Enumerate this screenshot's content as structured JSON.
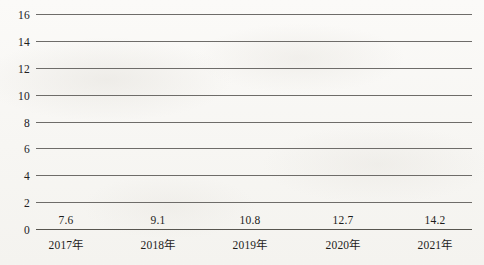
{
  "chart_data": {
    "type": "bar",
    "title": "",
    "subtitle": "",
    "xlabel": "",
    "ylabel": "",
    "categories": [
      "2017年",
      "2018年",
      "2019年",
      "2020年",
      "2021年"
    ],
    "values": [
      7.6,
      9.1,
      10.8,
      12.7,
      14.2
    ],
    "value_labels": [
      "7.6",
      "9.1",
      "10.8",
      "12.7",
      "14.2"
    ],
    "ylim": [
      0,
      16
    ],
    "ytick_step": 2,
    "yticks": [
      0,
      2,
      4,
      6,
      8,
      10,
      12,
      14,
      16
    ],
    "ytick_labels": [
      "0",
      "2",
      "4",
      "6",
      "8",
      "10",
      "12",
      "14",
      "16"
    ],
    "grid": true,
    "grid_axis": "y",
    "legend": false,
    "legend_position": "none",
    "series": [
      {
        "name": "",
        "values": [
          7.6,
          9.1,
          10.8,
          12.7,
          14.2
        ],
        "color": "#ef9aa8"
      }
    ],
    "colors": {
      "bar": "#ef9aa8",
      "gridline": "#6e6c69",
      "axis": "#57554f",
      "text": "#1d1d1b",
      "background": "#f8f7f4"
    }
  }
}
